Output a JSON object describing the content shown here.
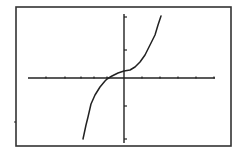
{
  "chart_data": {
    "type": "line",
    "title": "",
    "xlabel": "",
    "ylabel": "",
    "grid": false,
    "legend": null,
    "x_ticks_count_left": 5,
    "x_ticks_count_right": 5,
    "y_ticks_count_above": 2,
    "y_ticks_count_below": 2,
    "series": [
      {
        "name": "f(x)",
        "points_px": [
          [
            83,
            139
          ],
          [
            86,
            125
          ],
          [
            88,
            117
          ],
          [
            91,
            104
          ],
          [
            95,
            95
          ],
          [
            100,
            87
          ],
          [
            105,
            81
          ],
          [
            107,
            79
          ],
          [
            112,
            76
          ],
          [
            118,
            73
          ],
          [
            124,
            71
          ],
          [
            130,
            70
          ],
          [
            135,
            67
          ],
          [
            140,
            62
          ],
          [
            145,
            55
          ],
          [
            150,
            45
          ],
          [
            155,
            35
          ],
          [
            158,
            25
          ],
          [
            161,
            16
          ]
        ]
      }
    ]
  },
  "colors": {
    "background": "#ffffff",
    "ink": "#222222",
    "frame": "#333333"
  },
  "layout": {
    "frame": {
      "left": 16,
      "top": 7,
      "right": 231,
      "bottom": 146
    },
    "x_axis": {
      "y": 78,
      "x1": 28,
      "x2": 215
    },
    "y_axis": {
      "x": 124,
      "y1": 14,
      "y2": 143
    },
    "x_ticks": [
      46,
      65,
      81,
      94,
      107,
      142,
      160,
      178,
      196,
      214
    ],
    "y_ticks": [
      17,
      50,
      106,
      139
    ],
    "stray_mark": {
      "x": 15,
      "y": 122
    }
  }
}
